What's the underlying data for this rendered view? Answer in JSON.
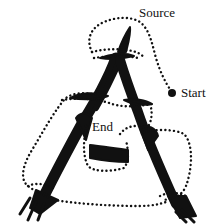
{
  "diagram": {
    "labels": {
      "source": "Source",
      "start": "Start",
      "end": "End"
    },
    "colors": {
      "ink": "#111111",
      "background": "#ffffff"
    }
  }
}
